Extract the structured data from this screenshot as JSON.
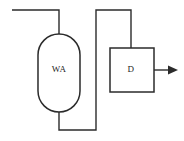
{
  "diagram": {
    "type": "process-flow-diagram",
    "width": 184,
    "height": 141,
    "background_color": "#ffffff",
    "line_color": "#2b2b2b",
    "units": [
      {
        "id": "vessel",
        "label": "WA",
        "shape": "stadium",
        "x": 38,
        "y": 34,
        "width": 42,
        "height": 78,
        "label_x": 59,
        "label_y": 70
      },
      {
        "id": "box",
        "label": "D",
        "shape": "rectangle",
        "x": 110,
        "y": 48,
        "width": 44,
        "height": 44,
        "label_x": 131,
        "label_y": 70
      }
    ],
    "streams": [
      {
        "id": "feed-inlet",
        "name": "feed-inlet-line",
        "path": "M 12 10 L 59 10 L 59 34",
        "has_arrow": false
      },
      {
        "id": "vessel-bottom-to-riser",
        "name": "vessel-outlet-line",
        "path": "M 59 112 L 59 130 L 96 130 L 96 10 L 131 10 L 131 48",
        "has_arrow": false
      },
      {
        "id": "product-outlet",
        "name": "product-outlet-line",
        "path": "M 154 70 L 170 70",
        "has_arrow": true,
        "arrow_points": "168,65.5 178,70 168,74.5"
      }
    ]
  }
}
